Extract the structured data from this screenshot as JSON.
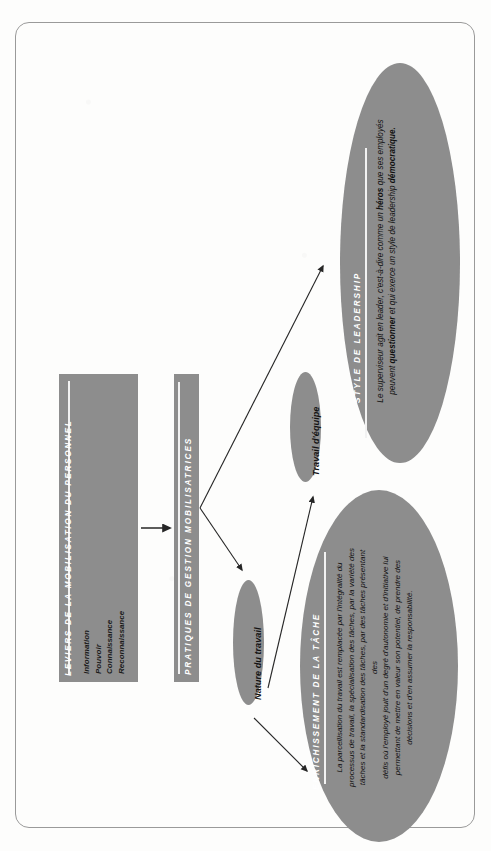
{
  "diagram": {
    "title": "Pratiques de gestion mobilisatrices",
    "accent_color": "#8d8d8d",
    "text_color_on_fill": "#ffffff",
    "body_text_color": "#111111",
    "frame_color": "#9a9a9a",
    "orientation": "rotated-90-counterclockwise"
  },
  "box_leviers": {
    "title": "LEVIERS DE LA MOBILISATION DU PERSONNEL",
    "items": [
      "Information",
      "Pouvoir",
      "Connaissance",
      "Reconnaissance"
    ]
  },
  "box_pratiques": {
    "title": "PRATIQUES DE GESTION MOBILISATRICES"
  },
  "ellipse_nature": {
    "label": "Nature du travail"
  },
  "ellipse_equipe": {
    "label": "Travail d'équipe"
  },
  "ellipse_enrichissement": {
    "title": "ENRICHISSEMENT DE LA TÂCHE",
    "body_lines": [
      "La parcellisation du travail est remplacée par l'intégralité du",
      "processus de travail, la spécialisation des tâches, par la variété des",
      "tâches et la standardisation des tâches, par des tâches présentant des",
      "défis où l'employé jouit d'un degré d'autonomie et d'initiative lui",
      "permettant de mettre en valeur son potentiel, de prendre des",
      "décisions et d'en assumer la responsabilité."
    ]
  },
  "ellipse_leadership": {
    "title": "STYLE DE LEADERSHIP",
    "body_segments": [
      {
        "text": "Le superviseur agit en leader, c'est-à-dire comme un ",
        "bold": false
      },
      {
        "text": "héros",
        "bold": true
      },
      {
        "text": " que ses employés peuvent ",
        "bold": false
      },
      {
        "text": "questionner",
        "bold": true
      },
      {
        "text": " et qui exerce un style de leadership ",
        "bold": false
      },
      {
        "text": "démocratique.",
        "bold": true
      }
    ]
  },
  "arrows": [
    {
      "name": "arrow-leviers-to-pratiques",
      "from": "box-leviers",
      "to": "box-pratiques"
    },
    {
      "name": "arrow-pratiques-to-nature",
      "from": "box-pratiques",
      "to": "ellipse-nature"
    },
    {
      "name": "arrow-pratiques-to-equipe",
      "from": "box-pratiques",
      "to": "ellipse-equipe"
    },
    {
      "name": "arrow-nature-to-enrichissement",
      "from": "ellipse-nature",
      "to": "ellipse-enrichissement"
    },
    {
      "name": "arrow-equipe-to-leadership",
      "from": "ellipse-equipe",
      "to": "ellipse-leadership"
    }
  ]
}
